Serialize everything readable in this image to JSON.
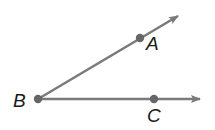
{
  "diagram": {
    "colors": {
      "ray": "#7a7a7a",
      "point": "#666666",
      "label": "#1a1a1a"
    },
    "vertex": {
      "label": "B",
      "x": 38,
      "y": 99
    },
    "rays": [
      {
        "name": "BA",
        "from": "B",
        "through": "A",
        "tip": {
          "x": 180,
          "y": 15
        }
      },
      {
        "name": "BC",
        "from": "B",
        "through": "C",
        "tip": {
          "x": 203,
          "y": 99
        }
      }
    ],
    "points": [
      {
        "label": "A",
        "x": 140,
        "y": 38
      },
      {
        "label": "B",
        "x": 38,
        "y": 99
      },
      {
        "label": "C",
        "x": 154,
        "y": 99
      }
    ],
    "labels": {
      "A": "A",
      "B": "B",
      "C": "C"
    }
  }
}
